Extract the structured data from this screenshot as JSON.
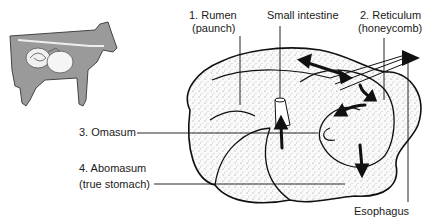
{
  "diagram": {
    "labels": {
      "rumen": {
        "line1": "1. Rumen",
        "line2": "(paunch)"
      },
      "small_intestine": {
        "line1": "Small intestine"
      },
      "reticulum": {
        "line1": "2. Reticulum",
        "line2": "(honeycomb)"
      },
      "omasum": {
        "line1": "3. Omasum"
      },
      "abomasum": {
        "line1": "4. Abomasum",
        "line2": "(true stomach)"
      },
      "esophagus": {
        "line1": "Esophagus"
      }
    },
    "inset": {
      "description": "cow silhouette with digestive tract"
    },
    "colors": {
      "ink": "#1a1a1a",
      "cow_fill": "#9a9a9a",
      "stomach_fill": "#f3f3f3"
    }
  }
}
